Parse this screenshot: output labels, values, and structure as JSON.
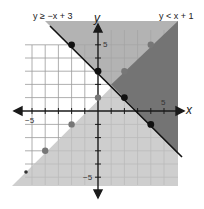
{
  "inequalities": [
    {
      "label": "y ≥ −x + 3",
      "boundary": "solid",
      "slope": -1,
      "intercept": 3,
      "shade": "above"
    },
    {
      "label": "y < x + 1",
      "boundary": "dashed",
      "slope": 1,
      "intercept": 1,
      "shade": "below"
    }
  ],
  "axes": {
    "x_label": "x",
    "y_label": "y",
    "x_tick_pos": "5",
    "x_tick_neg": "−5",
    "y_tick_pos": "5",
    "y_tick_neg": "−5"
  },
  "points_solid_line": [
    [
      -2,
      5
    ],
    [
      0,
      3
    ],
    [
      2,
      1
    ],
    [
      4,
      -1
    ]
  ],
  "points_dashed_line": [
    [
      -4,
      -3
    ],
    [
      -2,
      -1
    ],
    [
      0,
      1
    ],
    [
      2,
      3
    ],
    [
      4,
      5
    ]
  ],
  "colors": {
    "region_above_solid": "#a6a6a6",
    "region_below_dashed": "#c2c2c2",
    "overlap": "#6e6e6e",
    "grid": "#9a9a9a",
    "axis": "#1a1a1a",
    "solid_point": "#111111",
    "dashed_point": "#777777"
  }
}
